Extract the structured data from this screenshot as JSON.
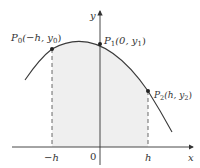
{
  "diagram": {
    "axes": {
      "x_label": "x",
      "y_label": "y",
      "origin_label": "0",
      "ticks": [
        {
          "label": "−h",
          "x": 52
        },
        {
          "label": "h",
          "x": 148
        }
      ]
    },
    "points": [
      {
        "id": "P0",
        "name": "P",
        "sub": "0",
        "coords_prefix": "(−h, y",
        "coords_sub": "0",
        "coords_suffix": ")",
        "x": 52,
        "y": 49
      },
      {
        "id": "P1",
        "name": "P",
        "sub": "1",
        "coords_prefix": "(0, y",
        "coords_sub": "1",
        "coords_suffix": ")",
        "x": 100,
        "y": 44
      },
      {
        "id": "P2",
        "name": "P",
        "sub": "2",
        "coords_prefix": "(h, y",
        "coords_sub": "2",
        "coords_suffix": ")",
        "x": 148,
        "y": 91
      }
    ],
    "colors": {
      "shade": "#efefef",
      "curve": "#3a3a3a",
      "axis": "#333333"
    }
  }
}
